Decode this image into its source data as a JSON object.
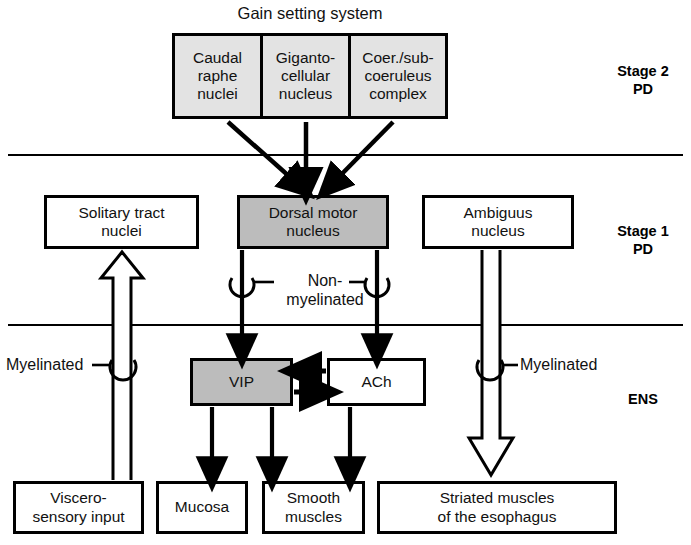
{
  "diagram": {
    "title": "Gain setting system",
    "stage_labels": [
      {
        "id": "stage2",
        "text": "Stage 2\nPD"
      },
      {
        "id": "stage1",
        "text": "Stage 1\nPD"
      },
      {
        "id": "ens",
        "text": "ENS"
      }
    ],
    "gain_setting_group": {
      "caption": "Gain setting system",
      "cells": [
        {
          "id": "caudal-raphe-nuclei",
          "text": "Caudal\nraphe\nnuclei"
        },
        {
          "id": "gigantocellular-nucleus",
          "text": "Giganto-\ncellular\nnucleus"
        },
        {
          "id": "coeruleus-subcoeruleus-complex",
          "text": "Coer./sub-\ncoeruleus\ncomplex"
        }
      ]
    },
    "boxes": [
      {
        "id": "solitary-tract-nuclei",
        "text": "Solitary tract\nnuclei",
        "shaded": false
      },
      {
        "id": "dorsal-motor-nucleus",
        "text": "Dorsal motor\nnucleus",
        "shaded": true
      },
      {
        "id": "ambiguus-nucleus",
        "text": "Ambiguus\nnucleus",
        "shaded": false
      },
      {
        "id": "vip",
        "text": "VIP",
        "shaded": true
      },
      {
        "id": "ach",
        "text": "ACh",
        "shaded": false
      },
      {
        "id": "viscero-sensory-input",
        "text": "Viscero-\nsensory input",
        "shaded": false
      },
      {
        "id": "mucosa",
        "text": "Mucosa",
        "shaded": false
      },
      {
        "id": "smooth-muscles",
        "text": "Smooth\nmuscles",
        "shaded": false
      },
      {
        "id": "striated-muscles-esophagus",
        "text": "Striated muscles\nof the esophagus",
        "shaded": false
      }
    ],
    "fiber_labels": [
      {
        "id": "nonmyelinated",
        "text": "Non-\nmyelinated"
      },
      {
        "id": "myelinated-left",
        "text": "Myelinated"
      },
      {
        "id": "myelinated-right",
        "text": "Myelinated"
      }
    ],
    "colors": {
      "stroke": "#000000",
      "shaded_fill": "#bcbcbc",
      "group_fill": "#e3e3e3",
      "background": "#ffffff"
    }
  }
}
